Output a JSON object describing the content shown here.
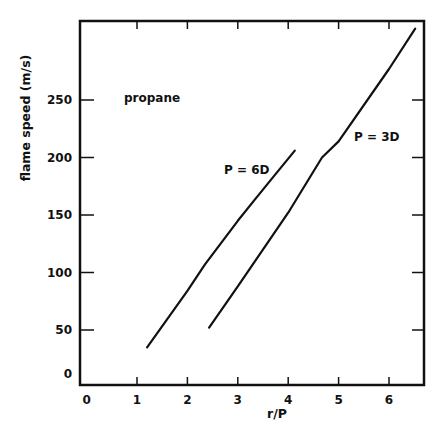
{
  "chart_data": {
    "type": "line",
    "title": "",
    "xlabel": "r/P",
    "ylabel": "flame speed (m/s)",
    "xlim": [
      0,
      6.7
    ],
    "ylim": [
      0,
      320
    ],
    "xticks": [
      0,
      1,
      2,
      3,
      4,
      5,
      6
    ],
    "yticks": [
      0,
      50,
      100,
      150,
      200,
      250
    ],
    "grid": false,
    "legend": "none (inline labels)",
    "annotations": [
      {
        "text": "propane",
        "x": 1.0,
        "y": 250
      },
      {
        "text": "P = 6D",
        "x": 3.2,
        "y": 190
      },
      {
        "text": "P = 3D",
        "x": 5.5,
        "y": 220
      }
    ],
    "series": [
      {
        "name": "P = 6D",
        "x": [
          1.2,
          2.0,
          2.35,
          3.0,
          3.33,
          3.7,
          4.13
        ],
        "y": [
          35,
          84,
          107,
          145,
          163,
          183,
          206
        ]
      },
      {
        "name": "P = 3D",
        "x": [
          2.43,
          3.0,
          4.0,
          4.67,
          5.0,
          6.0,
          6.52
        ],
        "y": [
          52,
          88,
          152,
          200,
          214,
          277,
          312
        ]
      }
    ]
  },
  "labels": {
    "xlabel": "r/P",
    "ylabel": "flame speed (m/s)",
    "propane": "propane",
    "p6d": "P = 6D",
    "p3d": "P = 3D"
  }
}
